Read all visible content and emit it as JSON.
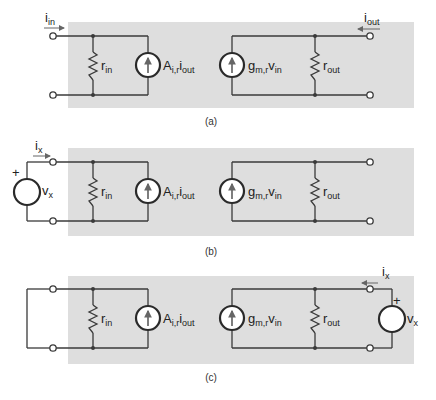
{
  "figure": {
    "panels": [
      {
        "id": "a",
        "caption": "(a)",
        "input_current": {
          "main": "i",
          "sub": "in"
        },
        "output_current": {
          "main": "i",
          "sub": "out"
        },
        "r_in": {
          "main": "r",
          "sub": "in"
        },
        "controlled_current_source_in": {
          "main": "A",
          "sub": "i,r",
          "main2": "i",
          "sub2": "out"
        },
        "controlled_current_source_out": {
          "main": "g",
          "sub": "m,r",
          "main2": "v",
          "sub2": "in"
        },
        "r_out": {
          "main": "r",
          "sub": "out"
        }
      },
      {
        "id": "b",
        "caption": "(b)",
        "test_current": {
          "main": "i",
          "sub": "x"
        },
        "test_voltage": {
          "main": "v",
          "sub": "x",
          "polarity": "+"
        },
        "r_in": {
          "main": "r",
          "sub": "in"
        },
        "controlled_current_source_in": {
          "main": "A",
          "sub": "i,r",
          "main2": "i",
          "sub2": "out"
        },
        "controlled_current_source_out": {
          "main": "g",
          "sub": "m,r",
          "main2": "v",
          "sub2": "in"
        },
        "r_out": {
          "main": "r",
          "sub": "out"
        }
      },
      {
        "id": "c",
        "caption": "(c)",
        "test_current": {
          "main": "i",
          "sub": "x"
        },
        "test_voltage": {
          "main": "v",
          "sub": "x",
          "polarity": "+"
        },
        "r_in": {
          "main": "r",
          "sub": "in"
        },
        "controlled_current_source_in": {
          "main": "A",
          "sub": "i,r",
          "main2": "i",
          "sub2": "out"
        },
        "controlled_current_source_out": {
          "main": "g",
          "sub": "m,r",
          "main2": "v",
          "sub2": "in"
        },
        "r_out": {
          "main": "r",
          "sub": "out"
        }
      }
    ],
    "colors": {
      "box_fill": "#dedede",
      "wire": "#3a3a3a"
    }
  }
}
